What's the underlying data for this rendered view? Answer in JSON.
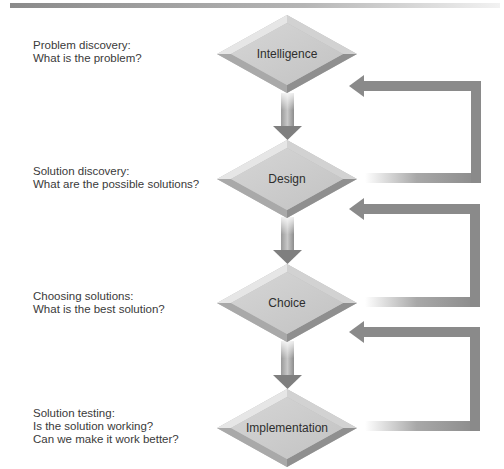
{
  "diagram": {
    "type": "decision-making process flowchart",
    "stages": [
      {
        "name": "Intelligence",
        "caption_title": "Problem discovery:",
        "caption_lines": [
          "What is the problem?"
        ]
      },
      {
        "name": "Design",
        "caption_title": "Solution discovery:",
        "caption_lines": [
          "What are the possible solutions?"
        ]
      },
      {
        "name": "Choice",
        "caption_title": "Choosing solutions:",
        "caption_lines": [
          "What is the best solution?"
        ]
      },
      {
        "name": "Implementation",
        "caption_title": "Solution testing:",
        "caption_lines": [
          "Is the solution working?",
          "Can we make it work better?"
        ]
      }
    ],
    "flow": [
      {
        "from": "Intelligence",
        "to": "Design",
        "kind": "down-arrow"
      },
      {
        "from": "Design",
        "to": "Choice",
        "kind": "down-arrow"
      },
      {
        "from": "Choice",
        "to": "Implementation",
        "kind": "down-arrow"
      },
      {
        "from": "Design",
        "to": "Intelligence",
        "kind": "feedback-loop"
      },
      {
        "from": "Choice",
        "to": "Design",
        "kind": "feedback-loop"
      },
      {
        "from": "Implementation",
        "to": "Choice",
        "kind": "feedback-loop"
      }
    ],
    "colors": {
      "diamond_face": "#c9c9c9",
      "diamond_light": "#e4e4e4",
      "diamond_dark": "#8c8c8c",
      "arrow": "#8a8a8a",
      "text": "#3a3a3a",
      "top_bar_dark": "#8a8a8a",
      "top_bar_light": "#f0f0f0"
    }
  }
}
